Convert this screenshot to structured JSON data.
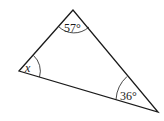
{
  "diagram": {
    "type": "triangle",
    "vertices": {
      "top": {
        "x": 73,
        "y": 10
      },
      "left": {
        "x": 19,
        "y": 71
      },
      "right": {
        "x": 158,
        "y": 112
      }
    },
    "angles": {
      "top": {
        "label": "57°"
      },
      "left": {
        "label": "x"
      },
      "right": {
        "label": "36°"
      }
    },
    "colors": {
      "stroke": "#1a1a1a",
      "background": "#ffffff"
    }
  }
}
